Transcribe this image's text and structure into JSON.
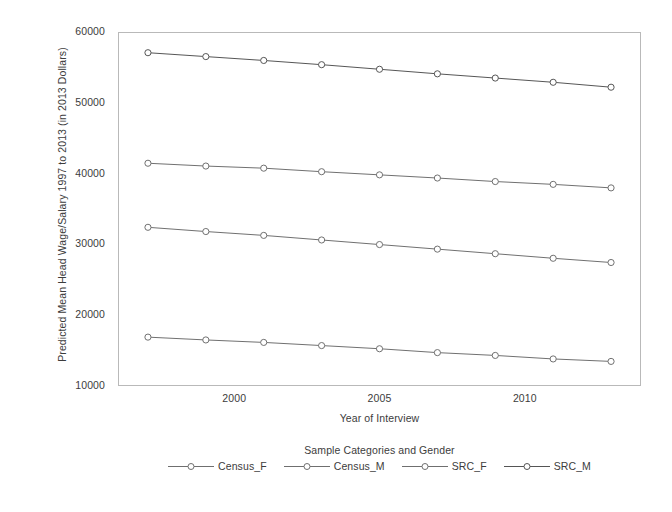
{
  "chart_data": {
    "type": "line",
    "title": "",
    "xlabel": "Year of Interview",
    "ylabel": "Predicted Mean Head Wage/Salary 1997 to 2013 (in 2013 Dollars)",
    "legend_title": "Sample Categories and Gender",
    "legend_position": "bottom",
    "grid": false,
    "xlim": [
      1996,
      2014
    ],
    "ylim": [
      10000,
      60000
    ],
    "x": [
      1997,
      1999,
      2001,
      2003,
      2005,
      2007,
      2009,
      2011,
      2013
    ],
    "xticks": [
      2000,
      2005,
      2010
    ],
    "yticks": [
      10000,
      20000,
      30000,
      40000,
      50000,
      60000
    ],
    "ytick_labels": [
      "10000",
      "20000",
      "30000",
      "40000",
      "50000",
      "60000"
    ],
    "xtick_labels": [
      "2000",
      "2005",
      "2010"
    ],
    "series": [
      {
        "name": "Census_F",
        "marker": "open-circle",
        "color": "#6f6f6f",
        "values": [
          16800,
          16400,
          16050,
          15600,
          15150,
          14600,
          14200,
          13700,
          13350
        ]
      },
      {
        "name": "Census_M",
        "marker": "open-circle",
        "color": "#6f6f6f",
        "values": [
          41500,
          41100,
          40800,
          40300,
          39850,
          39400,
          38900,
          38500,
          38000
        ]
      },
      {
        "name": "SRC_F",
        "marker": "open-circle",
        "color": "#6f6f6f",
        "values": [
          32400,
          31800,
          31250,
          30600,
          29950,
          29300,
          28650,
          28000,
          27400
        ]
      },
      {
        "name": "SRC_M",
        "marker": "open-circle",
        "color": "#555555",
        "values": [
          57200,
          56650,
          56100,
          55500,
          54850,
          54200,
          53600,
          53000,
          52300
        ]
      }
    ]
  },
  "axes": {
    "y_title": "Predicted Mean Head Wage/Salary 1997 to 2013 (in 2013 Dollars)",
    "x_title": "Year of Interview"
  },
  "legend": {
    "title": "Sample Categories and Gender",
    "entries": [
      {
        "label": "Census_F"
      },
      {
        "label": "Census_M"
      },
      {
        "label": "SRC_F"
      },
      {
        "label": "SRC_M"
      }
    ]
  },
  "colors": {
    "frame": "#b9b9b9",
    "line": "#6f6f6f",
    "text": "#3c3c3c",
    "background": "#ffffff"
  }
}
